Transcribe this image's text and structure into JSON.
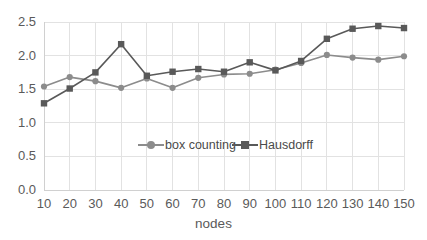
{
  "chart_data": {
    "type": "line",
    "title": "",
    "xlabel": "nodes",
    "ylabel": "",
    "x": [
      10,
      20,
      30,
      40,
      50,
      60,
      70,
      80,
      90,
      100,
      110,
      120,
      130,
      140,
      150
    ],
    "categories": [
      "10",
      "20",
      "30",
      "40",
      "50",
      "60",
      "70",
      "80",
      "90",
      "100",
      "110",
      "120",
      "130",
      "140",
      "150"
    ],
    "series": [
      {
        "name": "box counting",
        "marker": "circle",
        "color": "#8c8c8c",
        "values": [
          1.54,
          1.68,
          1.62,
          1.52,
          1.66,
          1.52,
          1.67,
          1.72,
          1.73,
          1.79,
          1.89,
          2.01,
          1.97,
          1.94,
          1.99
        ]
      },
      {
        "name": "Hausdorff",
        "marker": "square",
        "color": "#595959",
        "values": [
          1.29,
          1.51,
          1.75,
          2.17,
          1.7,
          1.76,
          1.8,
          1.76,
          1.9,
          1.78,
          1.92,
          2.25,
          2.4,
          2.44,
          2.41
        ]
      }
    ],
    "ylim": [
      0.0,
      2.5
    ],
    "yticks": [
      0.0,
      0.5,
      1.0,
      1.5,
      2.0,
      2.5
    ],
    "ytick_labels": [
      "0.0",
      "0.5",
      "1.0",
      "1.5",
      "2.0",
      "2.5"
    ],
    "xlim": [
      10,
      150
    ],
    "grid": true,
    "grid_color": "#e2e2e2",
    "legend_position": "center-inside",
    "background": "#ffffff"
  },
  "legend": {
    "items": [
      {
        "label": "box counting"
      },
      {
        "label": "Hausdorff"
      }
    ]
  },
  "axes": {
    "x_title": "nodes"
  }
}
